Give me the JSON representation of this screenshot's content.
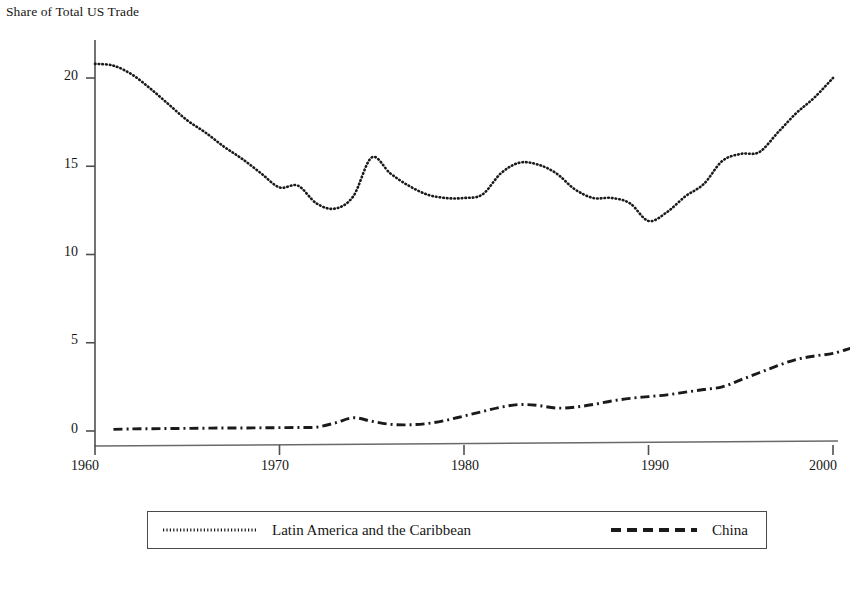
{
  "chart_data": {
    "type": "line",
    "title": "Share of Total US Trade",
    "xlabel": "",
    "ylabel": "Share of Total US Trade",
    "xlim": [
      1960,
      2001
    ],
    "ylim": [
      0,
      22
    ],
    "grid": false,
    "legend_position": "bottom",
    "xticks": [
      "1960",
      "1970",
      "1980",
      "1990",
      "2000"
    ],
    "xtick_values": [
      1960,
      1970,
      1980,
      1990,
      2000
    ],
    "yticks": [
      "0",
      "5",
      "10",
      "15",
      "20"
    ],
    "ytick_values": [
      0,
      5,
      10,
      15,
      20
    ],
    "x": [
      1960,
      1961,
      1962,
      1963,
      1964,
      1965,
      1966,
      1967,
      1968,
      1969,
      1970,
      1971,
      1972,
      1973,
      1974,
      1975,
      1976,
      1977,
      1978,
      1979,
      1980,
      1981,
      1982,
      1983,
      1984,
      1985,
      1986,
      1987,
      1988,
      1989,
      1990,
      1991,
      1992,
      1993,
      1994,
      1995,
      1996,
      1997,
      1998,
      1999,
      2000,
      2001
    ],
    "series": [
      {
        "name": "Latin America and the Caribbean",
        "style": "dotted",
        "color": "#1a1a1a",
        "values": [
          20.8,
          20.7,
          20.2,
          19.4,
          18.5,
          17.6,
          16.9,
          16.1,
          15.4,
          14.6,
          13.8,
          13.9,
          12.9,
          12.6,
          13.3,
          15.5,
          14.6,
          13.9,
          13.4,
          13.2,
          13.2,
          13.4,
          14.6,
          15.2,
          15.1,
          14.6,
          13.7,
          13.2,
          13.2,
          12.9,
          12.1,
          11.4,
          11.4,
          11.5,
          11.6,
          11.7,
          12.1,
          12.9,
          14.0,
          14.8,
          15.5,
          15.7
        ]
      },
      {
        "name": "China",
        "style": "dash-dot",
        "color": "#1a1a1a",
        "values": [
          0.08,
          0.09,
          0.12,
          0.13,
          0.14,
          0.15,
          0.16,
          0.17,
          0.17,
          0.18,
          0.19,
          0.2,
          0.22,
          0.45,
          0.75,
          0.55,
          0.38,
          0.35,
          0.42,
          0.6,
          0.85,
          1.1,
          1.35,
          1.5,
          1.45,
          1.3,
          1.35,
          1.5,
          1.7,
          1.85,
          1.95,
          2.05,
          2.2,
          2.35,
          2.5,
          2.9,
          3.3,
          3.7,
          4.05,
          4.25,
          4.4,
          4.7
        ]
      }
    ],
    "series_tail": {
      "note": "Latin America and the Caribbean continues past 1995 plateau to 20.0 at 2000",
      "lac_late": [
        {
          "year": 1990,
          "value": 11.9
        },
        {
          "year": 1991,
          "value": 12.4
        },
        {
          "year": 1992,
          "value": 13.3
        },
        {
          "year": 1993,
          "value": 14.0
        },
        {
          "year": 1994,
          "value": 15.3
        },
        {
          "year": 1995,
          "value": 15.7
        },
        {
          "year": 1996,
          "value": 15.8
        },
        {
          "year": 1997,
          "value": 16.9
        },
        {
          "year": 1998,
          "value": 18.0
        },
        {
          "year": 1999,
          "value": 18.9
        },
        {
          "year": 2000,
          "value": 20.0
        }
      ]
    }
  },
  "legend": {
    "entries": [
      {
        "label": "Latin America and the Caribbean",
        "style": "dotted"
      },
      {
        "label": "China",
        "style": "dashed"
      }
    ]
  },
  "footnote": {
    "text": ""
  }
}
